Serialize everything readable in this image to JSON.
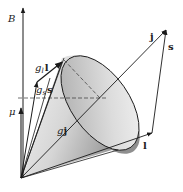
{
  "diagram": {
    "type": "vector-model-precession-cone",
    "labels": {
      "B": "B",
      "mu": "μ",
      "gl_l_g": "g",
      "gl_l_sub": "l",
      "gl_l_vec": "l",
      "gs_s_g": "g",
      "gs_s_sub": "s",
      "gs_s_vec": "s",
      "gj_g": "g",
      "gj_vec": "j",
      "j": "j",
      "s": "s",
      "l": "l"
    },
    "vectors": [
      {
        "name": "B",
        "from": [
          23,
          178
        ],
        "to": [
          23,
          8
        ]
      },
      {
        "name": "mu",
        "from": [
          21,
          178
        ],
        "to": [
          21,
          108
        ]
      },
      {
        "name": "gs_s",
        "from": [
          21,
          178
        ],
        "to": [
          37,
          82
        ]
      },
      {
        "name": "gl_l",
        "from": [
          37,
          82
        ],
        "to": [
          62,
          62
        ]
      },
      {
        "name": "gj",
        "from": [
          21,
          178
        ],
        "to": [
          62,
          62
        ]
      },
      {
        "name": "j",
        "from": [
          21,
          178
        ],
        "to": [
          166,
          30
        ]
      },
      {
        "name": "l",
        "from": [
          21,
          178
        ],
        "to": [
          152,
          133
        ]
      },
      {
        "name": "s",
        "from": [
          152,
          133
        ],
        "to": [
          166,
          30
        ]
      }
    ],
    "colors": {
      "line": "#1a1a1a",
      "cone_light": "#f2f2f2",
      "cone_dark": "#9a9a9a"
    }
  }
}
